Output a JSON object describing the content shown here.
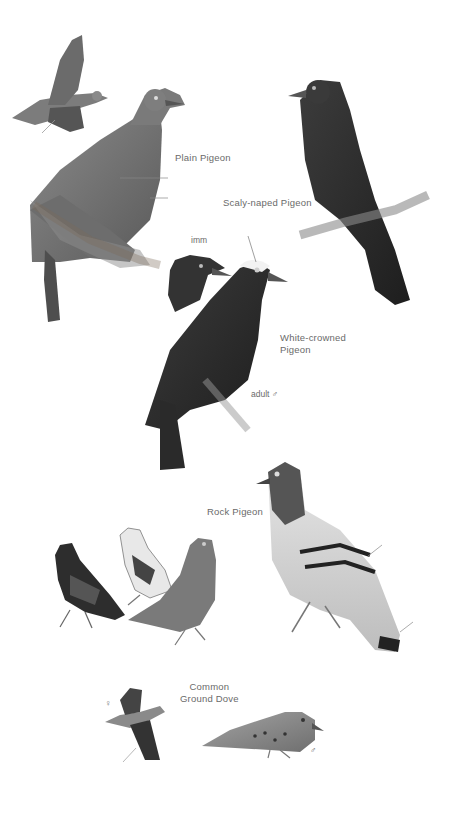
{
  "plate": {
    "background": "#ffffff",
    "label_color": "#6a6a6a",
    "species": [
      {
        "name": "Plain Pigeon",
        "figures": [
          "flight",
          "perched"
        ]
      },
      {
        "name": "Scaly-naped Pigeon",
        "figures": [
          "perched"
        ]
      },
      {
        "name": "White-crowned Pigeon",
        "figures": [
          "imm head",
          "adult male perched"
        ],
        "annotations": {
          "imm": "imm",
          "adult": "adult ♂"
        }
      },
      {
        "name": "Rock Pigeon",
        "figures": [
          "dark checkered",
          "pied",
          "red",
          "wild-type"
        ]
      },
      {
        "name": "Common Ground Dove",
        "figures": [
          "female flight",
          "male standing"
        ],
        "annotations": {
          "female": "♀",
          "male": "♂"
        }
      }
    ]
  },
  "labels": {
    "plain_pigeon": "Plain Pigeon",
    "scaly_naped": "Scaly-naped Pigeon",
    "white_crowned": "White-crowned\nPigeon",
    "imm": "imm",
    "adult_male": "adult ♂",
    "rock_pigeon": "Rock Pigeon",
    "ground_dove": "Common\nGround Dove",
    "female_symbol": "♀",
    "male_symbol": "♂"
  }
}
